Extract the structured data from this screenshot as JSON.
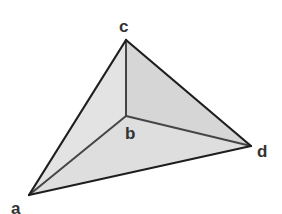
{
  "diagram": {
    "type": "tetrahedron",
    "vertices": {
      "a": {
        "label": "a",
        "x": 29,
        "y": 195,
        "label_x": 11,
        "label_y": 214
      },
      "b": {
        "label": "b",
        "x": 126,
        "y": 116,
        "label_x": 125,
        "label_y": 139
      },
      "c": {
        "label": "c",
        "x": 126,
        "y": 40,
        "label_x": 119,
        "label_y": 32
      },
      "d": {
        "label": "d",
        "x": 251,
        "y": 146,
        "label_x": 257,
        "label_y": 157
      }
    },
    "faces": [
      {
        "name": "face-abc",
        "points": "29,195 126,116 126,40",
        "fill": "#e3e3e3"
      },
      {
        "name": "face-bcd",
        "points": "126,116 126,40 251,146",
        "fill": "#d6d6d6"
      },
      {
        "name": "face-abd",
        "points": "29,195 126,116 251,146",
        "fill": "#dedede"
      }
    ],
    "edges": [
      {
        "name": "edge-ac",
        "from": "a",
        "to": "c",
        "style": "outer"
      },
      {
        "name": "edge-cd",
        "from": "c",
        "to": "d",
        "style": "outer"
      },
      {
        "name": "edge-ad",
        "from": "a",
        "to": "d",
        "style": "outer"
      },
      {
        "name": "edge-bc",
        "from": "b",
        "to": "c",
        "style": "inner"
      },
      {
        "name": "edge-ab",
        "from": "a",
        "to": "b",
        "style": "inner"
      },
      {
        "name": "edge-bd",
        "from": "b",
        "to": "d",
        "style": "inner"
      }
    ],
    "colors": {
      "outer_edge": "#1e1e1e",
      "inner_edge": "#454545",
      "label": "#333333",
      "background": "#ffffff"
    }
  }
}
